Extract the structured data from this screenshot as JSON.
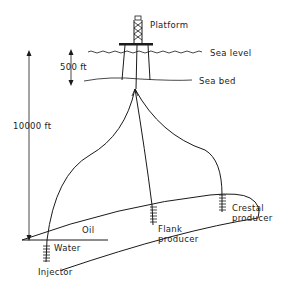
{
  "diagram": {
    "type": "offshore-oilfield-cross-section",
    "labels": {
      "platform": "Platform",
      "sea_level": "Sea level",
      "sea_bed": "Sea bed",
      "water_depth": "500 ft",
      "reservoir_depth": "10000 ft",
      "oil_zone": "Oil",
      "water_zone": "Water",
      "injector": "Injector",
      "flank_producer_line1": "Flank",
      "flank_producer_line2": "producer",
      "crestal_producer_line1": "Crestal",
      "crestal_producer_line2": "producer"
    },
    "wells": [
      {
        "name": "Injector",
        "role": "water injection"
      },
      {
        "name": "Flank producer",
        "role": "oil production"
      },
      {
        "name": "Crestal producer",
        "role": "oil production"
      }
    ],
    "colors": {
      "line": "#1a1a1a",
      "background": "#ffffff"
    }
  }
}
